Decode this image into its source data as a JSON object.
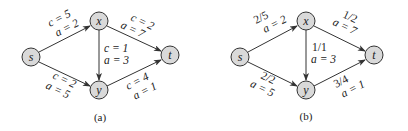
{
  "figures": [
    {
      "id": "a",
      "caption": "(a)",
      "nodes": [
        {
          "id": "s",
          "label": "s",
          "cx": 31,
          "cy": 57
        },
        {
          "id": "x",
          "label": "x",
          "cx": 99,
          "cy": 21
        },
        {
          "id": "y",
          "label": "y",
          "cx": 99,
          "cy": 90
        },
        {
          "id": "t",
          "label": "t",
          "cx": 170,
          "cy": 55
        }
      ],
      "edges": [
        {
          "from": "s",
          "to": "x",
          "line1": "c = 5",
          "line2": "a = 2"
        },
        {
          "from": "s",
          "to": "y",
          "line1": "c = 2",
          "line2": "a = 5"
        },
        {
          "from": "x",
          "to": "y",
          "line1": "c = 1",
          "line2": "a = 3"
        },
        {
          "from": "x",
          "to": "t",
          "line1": "c = 2",
          "line2": "a = 7"
        },
        {
          "from": "y",
          "to": "t",
          "line1": "c = 4",
          "line2": "a = 1"
        }
      ]
    },
    {
      "id": "b",
      "caption": "(b)",
      "nodes": [
        {
          "id": "s",
          "label": "s",
          "cx": 240,
          "cy": 57
        },
        {
          "id": "x",
          "label": "x",
          "cx": 306,
          "cy": 21
        },
        {
          "id": "y",
          "label": "y",
          "cx": 306,
          "cy": 90
        },
        {
          "id": "t",
          "label": "t",
          "cx": 374,
          "cy": 55
        }
      ],
      "edges": [
        {
          "from": "s",
          "to": "x",
          "line1": "2/5",
          "line2": "a = 2"
        },
        {
          "from": "s",
          "to": "y",
          "line1": "2/2",
          "line2": "a = 5"
        },
        {
          "from": "x",
          "to": "y",
          "line1": "1/1",
          "line2": "a = 3"
        },
        {
          "from": "x",
          "to": "t",
          "line1": "1/2",
          "line2": "a = 7"
        },
        {
          "from": "y",
          "to": "t",
          "line1": "3/4",
          "line2": "a = 1"
        }
      ]
    }
  ],
  "style": {
    "node_fill": "#d9d9d9",
    "stroke": "#333333",
    "node_r": 9
  }
}
